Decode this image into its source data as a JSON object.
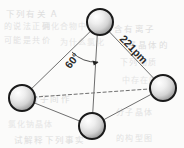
{
  "figure": {
    "kind": "molecular-geometry-diagram",
    "background_color": "#fbfbfa",
    "labels": {
      "bond_length": "221pm",
      "bond_angle": "60°"
    },
    "atoms": [
      {
        "id": "top",
        "name": "atom-top",
        "cx": 100,
        "cy": 22,
        "r": 13
      },
      {
        "id": "left",
        "name": "atom-left",
        "cx": 22,
        "cy": 98,
        "r": 13
      },
      {
        "id": "right",
        "name": "atom-right",
        "cx": 163,
        "cy": 88,
        "r": 13
      },
      {
        "id": "bottom",
        "name": "atom-bottom",
        "cx": 92,
        "cy": 126,
        "r": 13
      }
    ],
    "bonds": [
      {
        "name": "bond-top-left",
        "from": "top",
        "to": "left",
        "style": "solid"
      },
      {
        "name": "bond-top-right",
        "from": "top",
        "to": "right",
        "style": "solid"
      },
      {
        "name": "bond-top-bottom",
        "from": "top",
        "to": "bottom",
        "style": "solid"
      },
      {
        "name": "bond-left-bottom",
        "from": "left",
        "to": "bottom",
        "style": "solid"
      },
      {
        "name": "bond-right-bottom",
        "from": "right",
        "to": "bottom",
        "style": "solid"
      },
      {
        "name": "bond-left-right",
        "from": "left",
        "to": "right",
        "style": "dashed"
      }
    ],
    "sphere_colors": {
      "outline": "#1a1a1a",
      "highlight": "#ffffff",
      "midtone": "#d2d2d2",
      "shadow": "#8e8e8e"
    },
    "line_color": "#6e6e6e",
    "text_color": "#2b2b2b"
  },
  "ghost_text": {
    "note": "faint show-through text from reverse of printed page",
    "lines": [
      {
        "text": "下列有关 A",
        "x": 6,
        "y": 7
      },
      {
        "text": "的说法正确",
        "x": 4,
        "y": 20
      },
      {
        "text": "列化合物中",
        "x": 42,
        "y": 20
      },
      {
        "text": "中含有离子",
        "x": 104,
        "y": 22
      },
      {
        "text": "可能是共价",
        "x": 4,
        "y": 34
      },
      {
        "text": "为什么氯化",
        "x": 60,
        "y": 36
      },
      {
        "text": "子晶体的",
        "x": 128,
        "y": 38
      },
      {
        "text": "下列物质",
        "x": 120,
        "y": 56
      },
      {
        "text": "中存在的",
        "x": 122,
        "y": 74
      },
      {
        "text": "分子间作",
        "x": 30,
        "y": 92
      },
      {
        "text": "分子晶体",
        "x": 116,
        "y": 106
      },
      {
        "text": "氯化钠晶体",
        "x": 8,
        "y": 118
      },
      {
        "text": "试解释下列事实",
        "x": 14,
        "y": 133
      },
      {
        "text": "的构型图",
        "x": 116,
        "y": 132
      }
    ]
  }
}
